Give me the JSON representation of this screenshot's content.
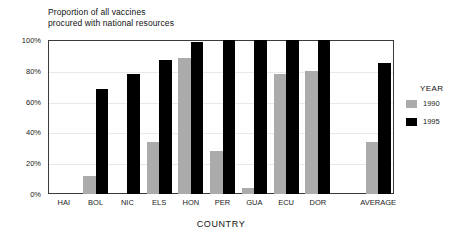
{
  "chart_data": {
    "type": "bar",
    "title": "Proportion of all vaccines\nprocured with national resources",
    "xlabel": "COUNTRY",
    "ylabel": "",
    "ylim": [
      0,
      100
    ],
    "grid": true,
    "legend_position": "right",
    "legend_title": "YEAR",
    "categories": [
      "HAI",
      "BOL",
      "NIC",
      "ELS",
      "HON",
      "PER",
      "GUA",
      "ECU",
      "DOR",
      "AVERAGE"
    ],
    "ytick_labels": [
      "0%",
      "20%",
      "40%",
      "60%",
      "80%",
      "100%"
    ],
    "ytick_values": [
      0,
      20,
      40,
      60,
      80,
      100
    ],
    "series": [
      {
        "name": "1990",
        "color": "#ababab",
        "values": [
          0,
          12,
          0,
          34,
          88,
          28,
          4,
          78,
          80,
          34
        ]
      },
      {
        "name": "1995",
        "color": "#000000",
        "values": [
          0,
          68,
          78,
          87,
          99,
          100,
          100,
          100,
          100,
          85
        ]
      }
    ]
  }
}
